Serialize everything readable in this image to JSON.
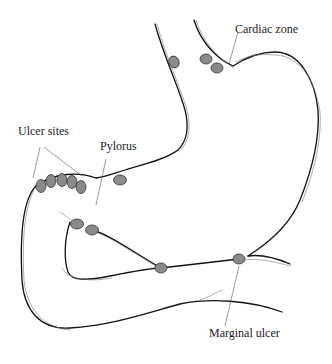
{
  "figure": {
    "labels": {
      "cardiac_zone": "Cardiac zone",
      "ulcer_sites": "Ulcer sites",
      "pylorus": "Pylorus",
      "marginal_ulcer": "Marginal ulcer"
    },
    "colors": {
      "outline": "#111111",
      "ulcer_fill": "#8a8a8a",
      "ulcer_stroke": "#333333",
      "leader_line": "#555555",
      "background": "#ffffff"
    },
    "ulcer_markers": [
      {
        "name": "esophagus-lesser-curve",
        "cx": 174,
        "cy": 62
      },
      {
        "name": "cardiac-1",
        "cx": 206,
        "cy": 59
      },
      {
        "name": "cardiac-2",
        "cx": 217,
        "cy": 68
      },
      {
        "name": "ulcer-site-1",
        "cx": 41,
        "cy": 186
      },
      {
        "name": "ulcer-site-2",
        "cx": 51,
        "cy": 181
      },
      {
        "name": "ulcer-site-3",
        "cx": 62,
        "cy": 180
      },
      {
        "name": "ulcer-site-4",
        "cx": 72,
        "cy": 182
      },
      {
        "name": "ulcer-site-5",
        "cx": 81,
        "cy": 187
      },
      {
        "name": "pylorus-ulcer",
        "cx": 120,
        "cy": 180
      },
      {
        "name": "anastomosis-1",
        "cx": 77,
        "cy": 224
      },
      {
        "name": "anastomosis-2",
        "cx": 92,
        "cy": 230
      },
      {
        "name": "jejunum-junction",
        "cx": 161,
        "cy": 268
      },
      {
        "name": "marginal-ulcer",
        "cx": 239,
        "cy": 259
      }
    ]
  }
}
